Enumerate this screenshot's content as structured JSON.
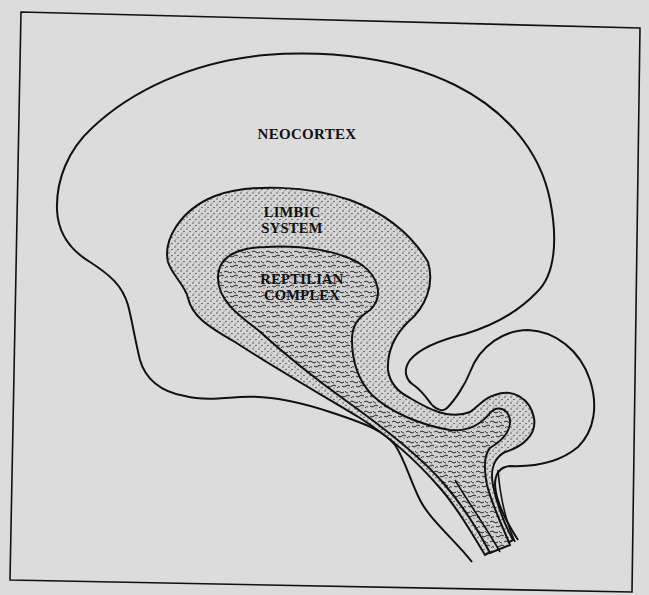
{
  "figure": {
    "type": "triune-brain-diagram",
    "colors": {
      "paper": "#dcdcdc",
      "ink": "#111111",
      "limbic_fill": "#d4d4d4",
      "reptilian_fill": "#cfcfcf"
    }
  },
  "regions": {
    "neocortex": {
      "label": "NEOCORTEX",
      "fill_style": "plain"
    },
    "limbic": {
      "line1": "LIMBIC",
      "line2": "SYSTEM",
      "fill_style": "stipple"
    },
    "reptilian": {
      "line1": "REPTILIAN",
      "line2": "COMPLEX",
      "fill_style": "squiggle"
    }
  }
}
